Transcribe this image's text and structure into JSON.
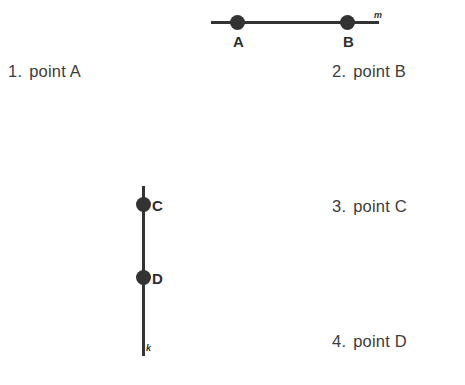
{
  "choices": [
    {
      "number": "1.",
      "label": "point A"
    },
    {
      "number": "2.",
      "label": "point B"
    },
    {
      "number": "3.",
      "label": "point C"
    },
    {
      "number": "4.",
      "label": "point D"
    }
  ],
  "figures": {
    "horizontal_line": {
      "line_name": "m",
      "points": [
        {
          "label": "A"
        },
        {
          "label": "B"
        }
      ]
    },
    "vertical_line": {
      "line_name": "k",
      "points": [
        {
          "label": "C"
        },
        {
          "label": "D"
        }
      ]
    }
  },
  "colors": {
    "ink": "#333333",
    "text": "#3c3c3c",
    "background": "#ffffff"
  }
}
